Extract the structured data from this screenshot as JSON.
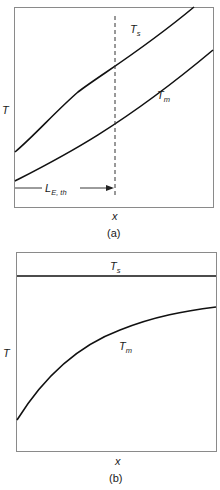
{
  "panels": [
    {
      "id": "a",
      "caption": "(a)",
      "y_axis_label": "T",
      "x_axis_label": "x",
      "curves": [
        {
          "name": "surface-temperature",
          "label_main": "T",
          "label_sub": "s",
          "shape": "increasing, slightly concave then linear"
        },
        {
          "name": "mean-temperature",
          "label_main": "T",
          "label_sub": "m",
          "shape": "increasing linear"
        }
      ],
      "marker": {
        "label_main": "L",
        "label_sub": "E, th",
        "description": "thermal entry length, dashed vertical line"
      }
    },
    {
      "id": "b",
      "caption": "(b)",
      "y_axis_label": "T",
      "x_axis_label": "x",
      "curves": [
        {
          "name": "surface-temperature",
          "label_main": "T",
          "label_sub": "s",
          "shape": "constant horizontal"
        },
        {
          "name": "mean-temperature",
          "label_main": "T",
          "label_sub": "m",
          "shape": "increasing, asymptotically approaching Ts"
        }
      ]
    }
  ]
}
